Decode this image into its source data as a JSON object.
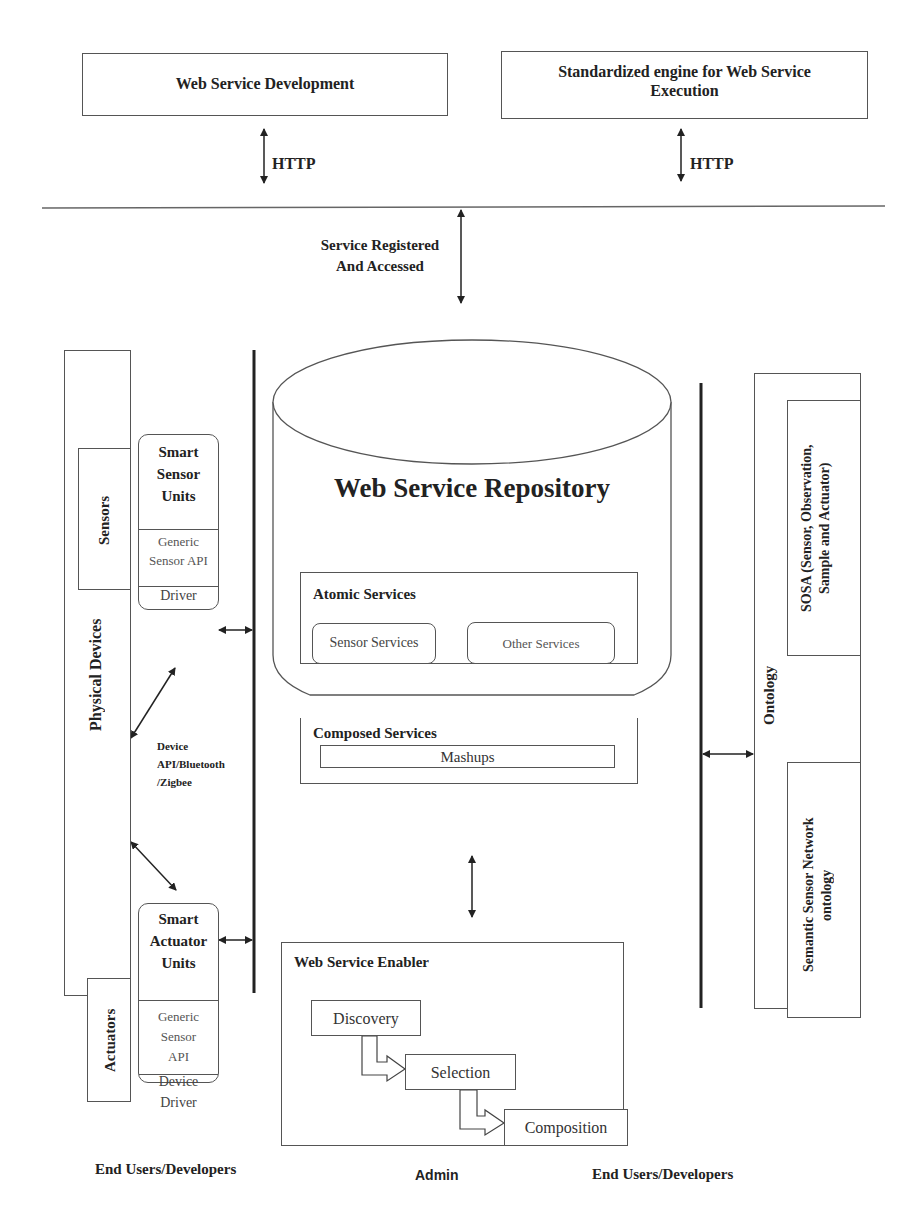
{
  "top": {
    "dev_box": "Web Service Development",
    "engine_box": "Standardized engine for Web Service Execution",
    "http_left": "HTTP",
    "http_right": "HTTP",
    "registered_label_1": "Service Registered",
    "registered_label_2": "And Accessed"
  },
  "left": {
    "physical_devices": "Physical Devices",
    "sensors": "Sensors",
    "actuators": "Actuators",
    "sensor_unit": {
      "title_1": "Smart",
      "title_2": "Sensor",
      "title_3": "Units",
      "api_1": "Generic",
      "api_2": "Sensor API",
      "driver": "Driver"
    },
    "actuator_unit": {
      "title_1": "Smart",
      "title_2": "Actuator",
      "title_3": "Units",
      "api_1": "Generic",
      "api_2": "Sensor",
      "api_3": "API",
      "driver_1": "Device",
      "driver_2": "Driver"
    },
    "protocol_1": "Device",
    "protocol_2": "API/Bluetooth",
    "protocol_3": "/Zigbee"
  },
  "repository": {
    "title": "Web Service Repository",
    "atomic_title": "Atomic Services",
    "sensor_services": "Sensor Services",
    "other_services": "Other Services",
    "composed_title": "Composed Services",
    "mashups": "Mashups"
  },
  "enabler": {
    "title": "Web Service Enabler",
    "steps": [
      "Discovery",
      "Selection",
      "Composition"
    ]
  },
  "right": {
    "ontology": "Ontology",
    "sosa_1": "SOSA (Sensor, Observation,",
    "sosa_2": "Sample and Actuator)",
    "ssn_1": "Semantic Sensor Network",
    "ssn_2": "ontology"
  },
  "footer": {
    "left": "End Users/Developers",
    "center": "Admin",
    "right": "End Users/Developers"
  }
}
